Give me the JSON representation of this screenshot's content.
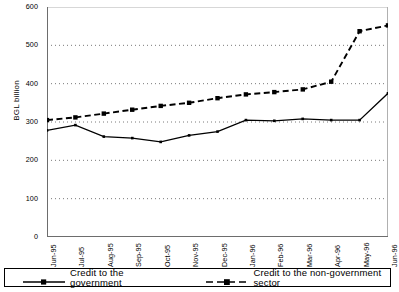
{
  "chart_data": {
    "type": "line",
    "title": "",
    "xlabel": "",
    "ylabel": "BGL billion",
    "ylim": [
      0,
      600
    ],
    "yticks": [
      0,
      100,
      200,
      300,
      400,
      500,
      600
    ],
    "ytick_labels": [
      "0",
      "100",
      "200",
      "300",
      "400",
      "500",
      "600"
    ],
    "grid": true,
    "grid_style": "dotted-horizontal",
    "legend_position": "bottom",
    "categories": [
      "Jun-95",
      "Jul-95",
      "Aug-95",
      "Sep-95",
      "Oct-95",
      "Nov-95",
      "Dec-95",
      "Jan-96",
      "Feb-96",
      "Mar-96",
      "Apr-96",
      "May-96",
      "Jun-96"
    ],
    "series": [
      {
        "name": "Credit to the government",
        "line_style": "solid",
        "marker": "small-square",
        "color": "#000000",
        "values": [
          278,
          292,
          262,
          258,
          248,
          265,
          275,
          305,
          303,
          308,
          305,
          305,
          375
        ]
      },
      {
        "name": "Credit to the non-government sector",
        "line_style": "dashed",
        "marker": "filled-square",
        "color": "#000000",
        "values": [
          305,
          312,
          322,
          332,
          342,
          350,
          362,
          372,
          378,
          385,
          405,
          537,
          552
        ]
      }
    ]
  },
  "legend": {
    "items": [
      {
        "label": "Credit to the government"
      },
      {
        "label": "Credit to the non-government sector"
      }
    ]
  }
}
